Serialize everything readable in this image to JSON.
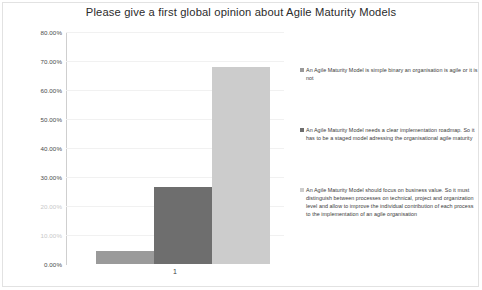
{
  "chart_data": {
    "type": "bar",
    "title": "Please give a first global opinion about Agile Maturity Models",
    "xlabel": "",
    "ylabel": "",
    "categories": [
      "1"
    ],
    "ylim": [
      0,
      80
    ],
    "ytick_labels": [
      "80.00%",
      "70.00%",
      "60.00%",
      "50.00%",
      "40.00%",
      "30.00%",
      "20.00%",
      "10.00%",
      "0.00%"
    ],
    "ytick_values": [
      80,
      70,
      60,
      50,
      40,
      30,
      20,
      10,
      0
    ],
    "grid": true,
    "legend_position": "right",
    "series": [
      {
        "name": "An Agile Maturity Model is simple binary an organisation is agile or it is not",
        "values": [
          4.5
        ],
        "color": "#9a9a9a"
      },
      {
        "name": "An Agile Maturity Model needs a clear implementation roadmap. So it has to be a staged model adressing the organisational agile maturity",
        "values": [
          26.5
        ],
        "color": "#6e6e6e"
      },
      {
        "name": "An Agile Maturity Model should focus on business value. So it must distinguish between processes on technical, project and organization level and allow to improve the individual contribution of each process to the implementation of an agile organisation",
        "values": [
          68.0
        ],
        "color": "#cccccc"
      }
    ]
  },
  "legend": {
    "entries": [
      {
        "marker": "square-swatch-icon",
        "label": "An Agile Maturity Model is simple binary an organisation is agile or it is not",
        "color": "#9a9a9a"
      },
      {
        "marker": "square-swatch-icon",
        "label": "An Agile Maturity Model needs a clear implementation roadmap. So it has to be a staged model adressing the organisational agile maturity",
        "color": "#6e6e6e"
      },
      {
        "marker": "square-swatch-icon",
        "label": "An Agile Maturity Model should focus on business value. So it must distinguish between processes on technical, project and organization level and allow to improve the individual contribution of each process to the implementation of an agile organisation",
        "color": "#cccccc"
      }
    ]
  },
  "axis": {
    "category_label": "1"
  },
  "colors": {
    "title": "#2b2b2b",
    "grid": "#f1f1f1",
    "axis": "#cfcfcf",
    "tick_text": "#4a4a4a",
    "tick_text_faded": "#c8c8c8"
  }
}
